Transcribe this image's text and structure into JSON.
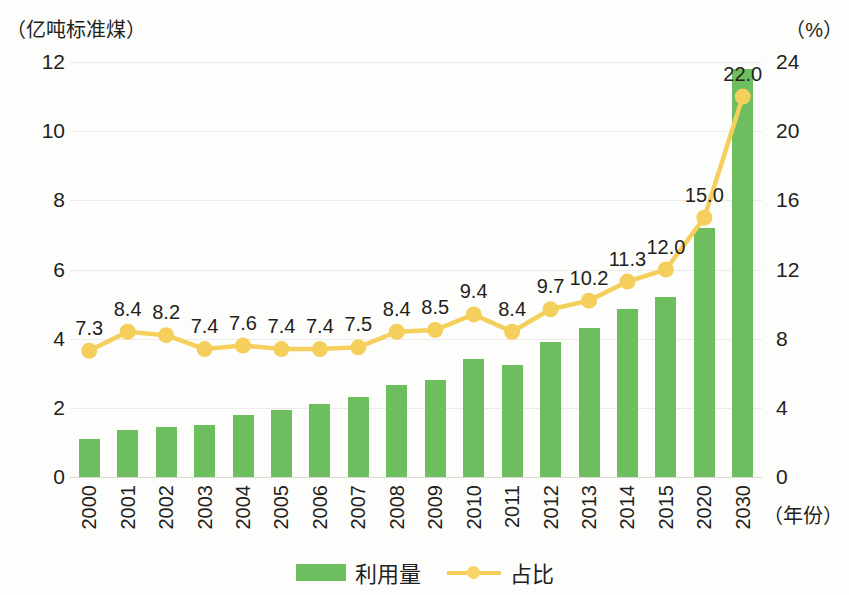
{
  "axes": {
    "y_left_title": "（亿吨标准煤）",
    "y_right_title": "（%）",
    "x_title": "（年份）"
  },
  "legend": {
    "bar_label": "利用量",
    "line_label": "占比"
  },
  "colors": {
    "bar": "#6cbe5f",
    "line": "#f5cf5c",
    "marker": "#f7d466",
    "text": "#231f1c",
    "grid": "#ecebe8",
    "background": "#fdfdfb"
  },
  "chart_data": {
    "type": "bar",
    "title": "",
    "subtitle": "",
    "xlabel": "（年份）",
    "ylabel": "（亿吨标准煤）",
    "y2label": "（%）",
    "categories": [
      "2000",
      "2001",
      "2002",
      "2003",
      "2004",
      "2005",
      "2006",
      "2007",
      "2008",
      "2009",
      "2010",
      "2011",
      "2012",
      "2013",
      "2014",
      "2015",
      "2020",
      "2030"
    ],
    "ylim": [
      0,
      12
    ],
    "yticks": [
      0,
      2,
      4,
      6,
      8,
      10,
      12
    ],
    "y2lim": [
      0,
      24
    ],
    "y2ticks": [
      0,
      4,
      8,
      12,
      16,
      20,
      24
    ],
    "grid": true,
    "legend_position": "bottom",
    "series": [
      {
        "name": "利用量",
        "type": "bar",
        "axis": "left",
        "unit": "亿吨标准煤",
        "color": "#6cbe5f",
        "values": [
          1.1,
          1.35,
          1.45,
          1.5,
          1.8,
          1.95,
          2.1,
          2.3,
          2.65,
          2.8,
          3.4,
          3.25,
          3.9,
          4.3,
          4.85,
          5.2,
          7.2,
          11.8
        ],
        "labels": [
          "",
          "",
          "",
          "",
          "",
          "",
          "",
          "",
          "",
          "",
          "",
          "",
          "",
          "",
          "",
          "",
          "",
          ""
        ]
      },
      {
        "name": "占比",
        "type": "line",
        "axis": "right",
        "unit": "%",
        "color": "#f5cf5c",
        "values": [
          7.3,
          8.4,
          8.2,
          7.4,
          7.6,
          7.4,
          7.4,
          7.5,
          8.4,
          8.5,
          9.4,
          8.4,
          9.7,
          10.2,
          11.3,
          12.0,
          15.0,
          22.0
        ],
        "labels": [
          "7.3",
          "8.4",
          "8.2",
          "7.4",
          "7.6",
          "7.4",
          "7.4",
          "7.5",
          "8.4",
          "8.5",
          "9.4",
          "8.4",
          "9.7",
          "10.2",
          "11.3",
          "12.0",
          "15.0",
          "22.0"
        ]
      }
    ]
  }
}
